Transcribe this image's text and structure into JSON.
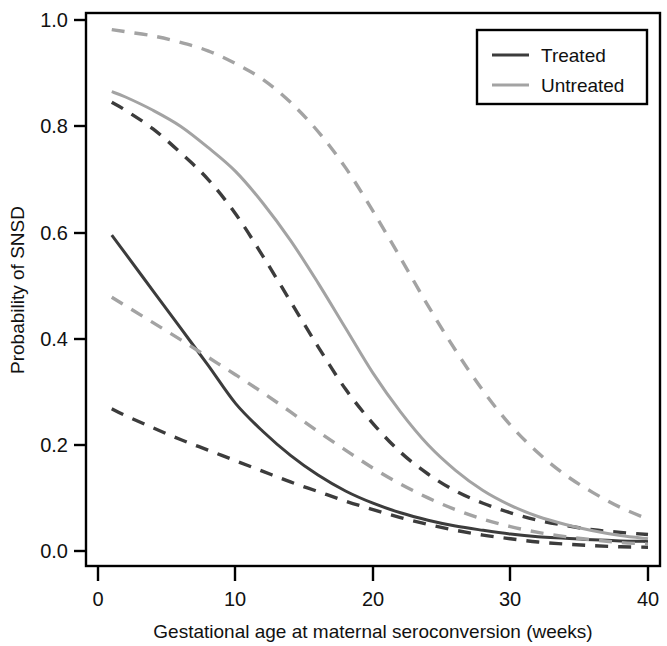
{
  "chart_data": {
    "type": "line",
    "title": "",
    "xlabel": "Gestational age at maternal seroconversion (weeks)",
    "ylabel": "Probability of SNSD",
    "xlim": [
      0,
      40
    ],
    "ylim": [
      0.0,
      1.0
    ],
    "xticks": [
      0,
      10,
      20,
      30,
      40
    ],
    "xtick_labels": [
      "0",
      "10",
      "20",
      "30",
      "40"
    ],
    "yticks": [
      0.0,
      0.2,
      0.4,
      0.6,
      0.8,
      1.0
    ],
    "ytick_labels": [
      "0.0",
      "0.2",
      "0.4",
      "0.6",
      "0.8",
      "1.0"
    ],
    "grid": false,
    "legend_position": "top-right",
    "colors": {
      "treated": "#3c3c3c",
      "untreated": "#a3a3a3",
      "frame": "#000000",
      "background": "#ffffff"
    },
    "x": [
      1,
      2,
      4,
      6,
      8,
      10,
      12,
      14,
      16,
      18,
      20,
      22,
      24,
      26,
      28,
      30,
      32,
      34,
      36,
      38,
      40
    ],
    "series": [
      {
        "name": "Treated",
        "style": "solid",
        "color": "#3c3c3c",
        "role": "point-estimate",
        "values": [
          0.595,
          0.56,
          0.49,
          0.42,
          0.35,
          0.278,
          0.225,
          0.18,
          0.143,
          0.113,
          0.09,
          0.072,
          0.058,
          0.047,
          0.039,
          0.032,
          0.027,
          0.024,
          0.021,
          0.019,
          0.018
        ]
      },
      {
        "name": "Treated upper 95% CI",
        "style": "dashed",
        "color": "#3c3c3c",
        "role": "upper-ci",
        "values": [
          0.845,
          0.83,
          0.795,
          0.75,
          0.7,
          0.635,
          0.555,
          0.47,
          0.385,
          0.305,
          0.24,
          0.186,
          0.145,
          0.113,
          0.09,
          0.072,
          0.058,
          0.048,
          0.04,
          0.035,
          0.031
        ]
      },
      {
        "name": "Treated lower 95% CI",
        "style": "dashed",
        "color": "#3c3c3c",
        "role": "lower-ci",
        "values": [
          0.268,
          0.255,
          0.232,
          0.21,
          0.19,
          0.17,
          0.15,
          0.13,
          0.112,
          0.094,
          0.078,
          0.063,
          0.05,
          0.039,
          0.03,
          0.023,
          0.017,
          0.013,
          0.01,
          0.008,
          0.007
        ]
      },
      {
        "name": "Untreated",
        "style": "solid",
        "color": "#a3a3a3",
        "role": "point-estimate",
        "values": [
          0.865,
          0.855,
          0.83,
          0.8,
          0.76,
          0.715,
          0.655,
          0.585,
          0.505,
          0.42,
          0.335,
          0.262,
          0.2,
          0.152,
          0.114,
          0.086,
          0.065,
          0.05,
          0.038,
          0.029,
          0.023
        ]
      },
      {
        "name": "Untreated upper 95% CI",
        "style": "dashed",
        "color": "#a3a3a3",
        "role": "upper-ci",
        "values": [
          0.982,
          0.978,
          0.97,
          0.958,
          0.942,
          0.918,
          0.888,
          0.845,
          0.79,
          0.722,
          0.64,
          0.552,
          0.462,
          0.378,
          0.302,
          0.237,
          0.185,
          0.143,
          0.11,
          0.082,
          0.06
        ]
      },
      {
        "name": "Untreated lower 95% CI",
        "style": "dashed",
        "color": "#a3a3a3",
        "role": "lower-ci",
        "values": [
          0.478,
          0.462,
          0.43,
          0.398,
          0.365,
          0.332,
          0.298,
          0.262,
          0.225,
          0.19,
          0.156,
          0.126,
          0.1,
          0.078,
          0.06,
          0.046,
          0.035,
          0.027,
          0.021,
          0.016,
          0.013
        ]
      }
    ],
    "legend": [
      {
        "label": "Treated",
        "color": "#3c3c3c",
        "style": "solid"
      },
      {
        "label": "Untreated",
        "color": "#a3a3a3",
        "style": "solid"
      }
    ]
  }
}
